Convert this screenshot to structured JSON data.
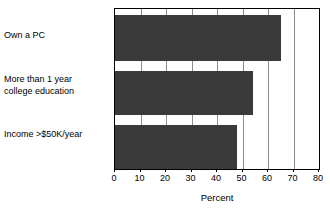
{
  "chart_data": {
    "type": "bar",
    "orientation": "horizontal",
    "title": "",
    "subtitle": "",
    "xlabel": "Percent",
    "ylabel": "",
    "categories": [
      "Own a PC",
      "More than 1 year\ncollege education",
      "Income >$50K/year"
    ],
    "values": [
      65,
      54,
      48
    ],
    "xlim": [
      0,
      80
    ],
    "xticks": [
      0,
      10,
      20,
      30,
      40,
      50,
      60,
      70,
      80
    ],
    "xtick_labels": [
      "0",
      "10",
      "20",
      "30",
      "40",
      "50",
      "60",
      "70",
      "80"
    ],
    "grid": "vertical",
    "legend": null,
    "series": [
      {
        "name": "Percent",
        "values": [
          65,
          54,
          48
        ]
      }
    ]
  },
  "colors": {
    "bar": "#3a3a3a",
    "plot_background": "#ffffff",
    "frame": "#000000",
    "gridline": "#8c8c8c",
    "text": "#000000"
  }
}
